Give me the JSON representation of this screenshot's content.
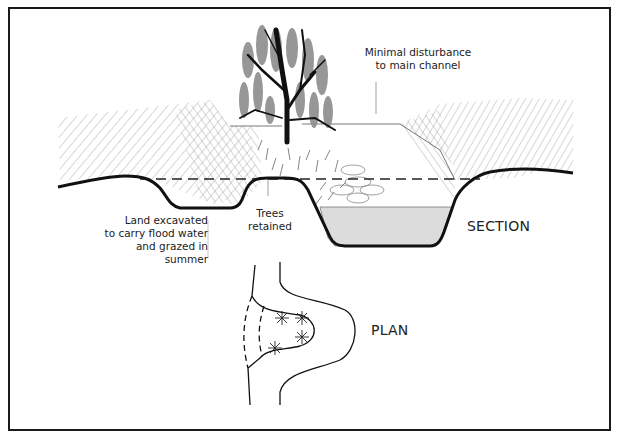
{
  "diagram": {
    "section_label": "SECTION",
    "plan_label": "PLAN",
    "annotations": {
      "main_channel": [
        "Minimal disturbance",
        "to main channel"
      ],
      "excavated_land": [
        "Land excavated",
        "to carry flood water",
        "and grazed in summer"
      ],
      "trees": [
        "Trees",
        "retained"
      ]
    },
    "colors": {
      "line": "#111111",
      "hatch": "#8a8a8a",
      "water_fill": "#dcdcdc",
      "foliage": "#8c8c8c",
      "frame": "#1a1a1a"
    }
  }
}
